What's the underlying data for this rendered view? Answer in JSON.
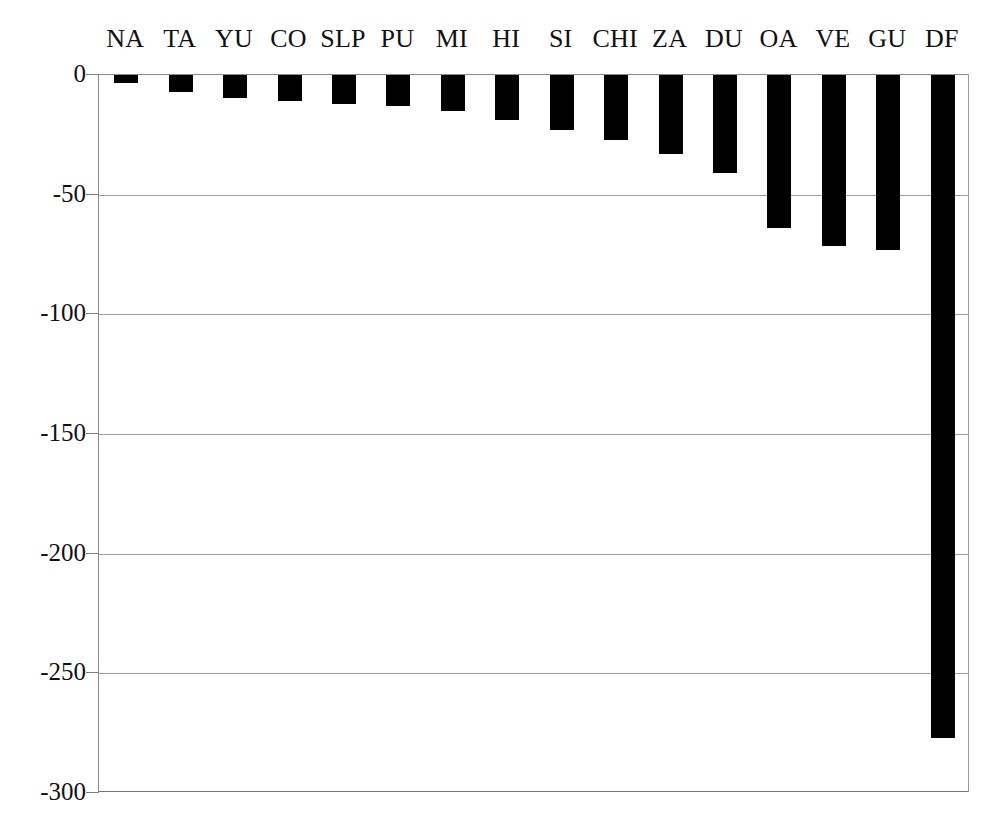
{
  "chart_data": {
    "type": "bar",
    "title": "",
    "subtitle": "",
    "xlabel": "",
    "ylabel": "",
    "orientation": "vertical",
    "grid": true,
    "legend": null,
    "legend_position": "none",
    "bar_color": "#000000",
    "background_color": "#ffffff",
    "gridline_color": "#9d9d9d",
    "axis_color": "#808080",
    "categories": [
      "NA",
      "TA",
      "YU",
      "CO",
      "SLP",
      "PU",
      "MI",
      "HI",
      "SI",
      "CHI",
      "ZA",
      "DU",
      "OA",
      "VE",
      "GU",
      "DF"
    ],
    "values": [
      -3.5,
      -7,
      -9.5,
      -11,
      -12,
      -13,
      -15,
      -19,
      -23,
      -27,
      -33,
      -41,
      -64,
      -71.5,
      -73,
      -277
    ],
    "ylim": [
      -300,
      0
    ],
    "ytick_labels": [
      "0",
      "-50",
      "-100",
      "-150",
      "-200",
      "-250",
      "-300"
    ],
    "ytick_values": [
      0,
      -50,
      -100,
      -150,
      -200,
      -250,
      -300
    ],
    "xaxis_position": "top",
    "xtick_labels": [
      "NA",
      "TA",
      "YU",
      "CO",
      "SLP",
      "PU",
      "MI",
      "HI",
      "SI",
      "CHI",
      "ZA",
      "DU",
      "OA",
      "VE",
      "GU",
      "DF"
    ]
  }
}
